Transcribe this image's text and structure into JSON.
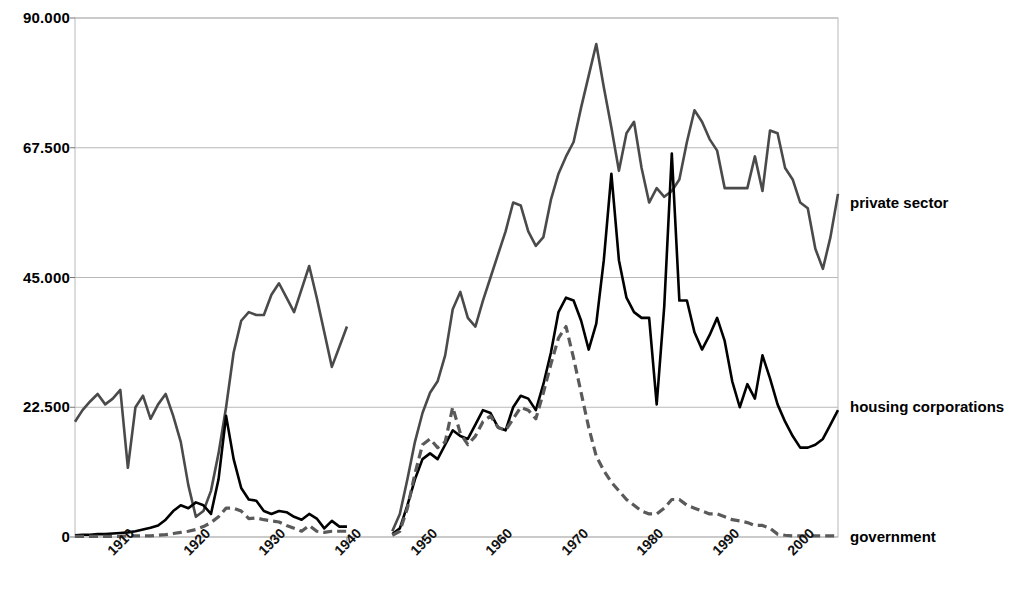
{
  "chart_data": {
    "type": "line",
    "title": "",
    "xlabel": "",
    "ylabel": "",
    "xlim": [
      1904,
      2005
    ],
    "ylim": [
      0,
      90
    ],
    "grid": true,
    "legend_position": "right-inline",
    "yticks": [
      "0",
      "22.500",
      "45.000",
      "67.500",
      "90.000"
    ],
    "ytick_values": [
      0,
      22.5,
      45,
      67.5,
      90
    ],
    "xticks": [
      "1910",
      "1920",
      "1930",
      "1940",
      "1950",
      "1960",
      "1970",
      "1980",
      "1990",
      "2000"
    ],
    "xtick_values": [
      1910,
      1920,
      1930,
      1940,
      1950,
      1960,
      1970,
      1980,
      1990,
      2000
    ],
    "data_gap_years": [
      1941,
      1945
    ],
    "series": [
      {
        "name": "private sector",
        "color": "#4a4a4a",
        "style": "solid",
        "label_y_value": 58,
        "x": [
          1904,
          1905,
          1906,
          1907,
          1908,
          1909,
          1910,
          1911,
          1912,
          1913,
          1914,
          1915,
          1916,
          1917,
          1918,
          1919,
          1920,
          1921,
          1922,
          1923,
          1924,
          1925,
          1926,
          1927,
          1928,
          1929,
          1930,
          1931,
          1932,
          1933,
          1934,
          1935,
          1936,
          1937,
          1938,
          1939,
          1940,
          1946,
          1947,
          1948,
          1949,
          1950,
          1951,
          1952,
          1953,
          1954,
          1955,
          1956,
          1957,
          1958,
          1959,
          1960,
          1961,
          1962,
          1963,
          1964,
          1965,
          1966,
          1967,
          1968,
          1969,
          1970,
          1971,
          1972,
          1973,
          1974,
          1975,
          1976,
          1977,
          1978,
          1979,
          1980,
          1981,
          1982,
          1983,
          1984,
          1985,
          1986,
          1987,
          1988,
          1989,
          1990,
          1991,
          1992,
          1993,
          1994,
          1995,
          1996,
          1997,
          1998,
          1999,
          2000,
          2001,
          2002,
          2003,
          2004,
          2005
        ],
        "values": [
          20.0,
          22.0,
          23.5,
          24.8,
          23.0,
          24.0,
          25.5,
          12.0,
          22.5,
          24.5,
          20.5,
          23.0,
          24.8,
          21.0,
          16.5,
          9.0,
          3.5,
          4.5,
          8.0,
          14.5,
          22.5,
          32.0,
          37.5,
          39.0,
          38.5,
          38.5,
          42.0,
          44.0,
          41.5,
          39.0,
          43.0,
          47.0,
          41.5,
          35.5,
          29.5,
          33.0,
          36.5,
          1.0,
          4.0,
          10.0,
          16.5,
          21.5,
          25.0,
          27.0,
          31.5,
          39.5,
          42.5,
          38.0,
          36.5,
          41.0,
          45.0,
          49.0,
          53.0,
          58.0,
          57.5,
          53.0,
          50.5,
          52.0,
          58.5,
          63.0,
          66.0,
          68.5,
          74.5,
          80.0,
          85.5,
          78.0,
          71.0,
          63.5,
          70.0,
          72.0,
          64.0,
          58.0,
          60.5,
          59.0,
          60.0,
          62.0,
          68.5,
          74.0,
          72.0,
          69.0,
          67.0,
          60.5,
          60.5,
          60.5,
          60.5,
          66.0,
          60.0,
          70.5,
          70.0,
          64.0,
          62.0,
          58.0,
          57.0,
          50.0,
          46.5,
          52.0,
          59.5
        ]
      },
      {
        "name": "housing corporations",
        "color": "#000000",
        "style": "solid",
        "label_y_value": 22.5,
        "x": [
          1904,
          1905,
          1906,
          1907,
          1908,
          1909,
          1910,
          1911,
          1912,
          1913,
          1914,
          1915,
          1916,
          1917,
          1918,
          1919,
          1920,
          1921,
          1922,
          1923,
          1924,
          1925,
          1926,
          1927,
          1928,
          1929,
          1930,
          1931,
          1932,
          1933,
          1934,
          1935,
          1936,
          1937,
          1938,
          1939,
          1940,
          1946,
          1947,
          1948,
          1949,
          1950,
          1951,
          1952,
          1953,
          1954,
          1955,
          1956,
          1957,
          1958,
          1959,
          1960,
          1961,
          1962,
          1963,
          1964,
          1965,
          1966,
          1967,
          1968,
          1969,
          1970,
          1971,
          1972,
          1973,
          1974,
          1975,
          1976,
          1977,
          1978,
          1979,
          1980,
          1981,
          1982,
          1983,
          1984,
          1985,
          1986,
          1987,
          1988,
          1989,
          1990,
          1991,
          1992,
          1993,
          1994,
          1995,
          1996,
          1997,
          1998,
          1999,
          2000,
          2001,
          2002,
          2003,
          2004,
          2005
        ],
        "values": [
          0.3,
          0.4,
          0.4,
          0.5,
          0.5,
          0.6,
          0.7,
          0.8,
          1.0,
          1.3,
          1.6,
          2.0,
          3.0,
          4.5,
          5.5,
          5.0,
          6.0,
          5.5,
          4.0,
          10.0,
          21.0,
          13.5,
          8.5,
          6.5,
          6.3,
          4.5,
          4.0,
          4.5,
          4.3,
          3.5,
          3.0,
          4.0,
          3.2,
          1.5,
          2.8,
          1.8,
          1.8,
          0.5,
          1.5,
          5.5,
          10.0,
          13.5,
          14.5,
          13.5,
          16.0,
          18.5,
          17.5,
          17.0,
          19.5,
          22.0,
          21.5,
          19.0,
          18.5,
          22.5,
          24.5,
          24.0,
          22.0,
          26.5,
          32.0,
          39.0,
          41.5,
          41.0,
          37.5,
          32.5,
          37.0,
          48.0,
          63.0,
          48.0,
          41.5,
          39.0,
          38.0,
          38.0,
          23.0,
          40.0,
          66.5,
          41.0,
          41.0,
          35.5,
          32.5,
          35.0,
          38.0,
          34.0,
          27.0,
          22.5,
          26.5,
          24.0,
          31.5,
          27.5,
          23.0,
          20.0,
          17.5,
          15.5,
          15.5,
          16.0,
          17.0,
          19.5,
          22.0
        ]
      },
      {
        "name": "government",
        "color": "#5a5a5a",
        "style": "dashed",
        "label_y_value": 0,
        "x": [
          1904,
          1905,
          1906,
          1907,
          1908,
          1909,
          1910,
          1911,
          1912,
          1913,
          1914,
          1915,
          1916,
          1917,
          1918,
          1919,
          1920,
          1921,
          1922,
          1923,
          1924,
          1925,
          1926,
          1927,
          1928,
          1929,
          1930,
          1931,
          1932,
          1933,
          1934,
          1935,
          1936,
          1937,
          1938,
          1939,
          1940,
          1946,
          1947,
          1948,
          1949,
          1950,
          1951,
          1952,
          1953,
          1954,
          1955,
          1956,
          1957,
          1958,
          1959,
          1960,
          1961,
          1962,
          1963,
          1964,
          1965,
          1966,
          1967,
          1968,
          1969,
          1970,
          1971,
          1972,
          1973,
          1974,
          1975,
          1976,
          1977,
          1978,
          1979,
          1980,
          1981,
          1982,
          1983,
          1984,
          1985,
          1986,
          1987,
          1988,
          1989,
          1990,
          1991,
          1992,
          1993,
          1994,
          1995,
          1996,
          1997,
          1998,
          1999,
          2000,
          2001,
          2002,
          2003,
          2004,
          2005
        ],
        "values": [
          0.1,
          0.1,
          0.1,
          0.1,
          0.1,
          0.1,
          0.1,
          0.2,
          0.2,
          0.2,
          0.2,
          0.3,
          0.4,
          0.6,
          0.8,
          1.0,
          1.3,
          1.8,
          2.5,
          3.5,
          5.0,
          5.0,
          4.5,
          3.2,
          3.3,
          3.0,
          2.8,
          2.6,
          2.0,
          1.5,
          1.0,
          2.0,
          1.0,
          0.8,
          1.0,
          1.0,
          1.0,
          0.3,
          1.0,
          5.0,
          11.0,
          16.0,
          17.0,
          15.5,
          16.5,
          22.5,
          18.0,
          16.0,
          17.5,
          20.0,
          21.0,
          19.0,
          18.5,
          20.5,
          22.5,
          22.0,
          20.5,
          25.0,
          30.0,
          34.5,
          36.5,
          31.0,
          25.0,
          19.0,
          14.0,
          11.5,
          9.5,
          8.0,
          6.5,
          5.5,
          4.5,
          4.0,
          4.0,
          5.0,
          6.5,
          6.5,
          5.5,
          5.0,
          4.5,
          4.0,
          4.0,
          3.5,
          3.0,
          2.8,
          2.5,
          2.0,
          2.0,
          1.5,
          0.5,
          0.3,
          0.2,
          0.2,
          0.2,
          0.2,
          0.2,
          0.2,
          0.2
        ]
      }
    ]
  },
  "axes": {
    "plot_left": 75,
    "plot_right": 838,
    "plot_top": 18,
    "plot_bottom": 537
  }
}
